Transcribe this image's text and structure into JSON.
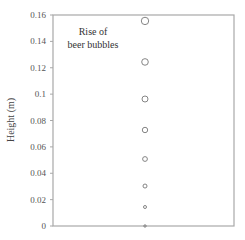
{
  "chart_data": {
    "type": "scatter",
    "title": "",
    "annotation": [
      "Rise of",
      "beer bubbles"
    ],
    "xlabel": "",
    "ylabel": "Height (m)",
    "ylim": [
      0,
      0.16
    ],
    "yticks": [
      0,
      0.02,
      0.04,
      0.06,
      0.08,
      0.1,
      0.12,
      0.14,
      0.16
    ],
    "ytick_labels": [
      "0",
      "0.02",
      "0.04",
      "0.06",
      "0.08",
      "0.1",
      "0.12",
      "0.14",
      "0.16"
    ],
    "grid": false,
    "series": [
      {
        "name": "bubble positions",
        "x": [
          0.5,
          0.5,
          0.5,
          0.5,
          0.5,
          0.5,
          0.5,
          0.5
        ],
        "values": [
          0.0,
          0.0144,
          0.0303,
          0.0508,
          0.0728,
          0.0963,
          0.1244,
          0.1555
        ],
        "marker_radius_px": [
          1.2,
          1.5,
          2.0,
          2.4,
          2.7,
          3.0,
          3.3,
          3.7
        ],
        "marker": "open-circle"
      }
    ]
  },
  "colors": {
    "axis": "#9a9a9a",
    "marker": "#777777",
    "text": "#444444"
  }
}
